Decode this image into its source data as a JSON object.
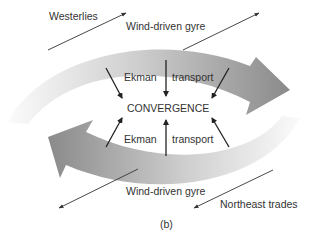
{
  "diagram": {
    "labels": {
      "westerlies": "Westerlies",
      "gyre_top": "Wind-driven gyre",
      "ekman_top": "Ekman",
      "transport_top": "transport",
      "convergence": "CONVERGENCE",
      "ekman_bottom": "Ekman",
      "transport_bottom": "transport",
      "gyre_bottom": "Wind-driven gyre",
      "northeast_trades": "Northeast trades",
      "panel": "(b)"
    },
    "colors": {
      "gyre_dark": "#8c8c8c",
      "gyre_light": "#f2f2f2",
      "arrow": "#222222",
      "text": "#333333"
    }
  }
}
